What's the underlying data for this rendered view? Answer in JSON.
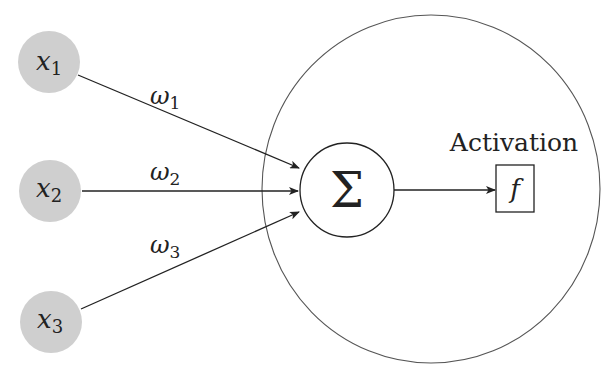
{
  "diagram": {
    "colors": {
      "input_fill": "#cfcfcf",
      "stroke": "#222222",
      "outer_circle": "#555555",
      "background": "#ffffff"
    },
    "inputs": [
      {
        "id": "x1",
        "symbol": "x",
        "subscript": "1"
      },
      {
        "id": "x2",
        "symbol": "x",
        "subscript": "2"
      },
      {
        "id": "x3",
        "symbol": "x",
        "subscript": "3"
      }
    ],
    "weights": [
      {
        "id": "w1",
        "symbol": "ω",
        "subscript": "1"
      },
      {
        "id": "w2",
        "symbol": "ω",
        "subscript": "2"
      },
      {
        "id": "w3",
        "symbol": "ω",
        "subscript": "3"
      }
    ],
    "summation": {
      "symbol": "Σ"
    },
    "activation": {
      "label": "Activation",
      "function_symbol": "f"
    }
  }
}
